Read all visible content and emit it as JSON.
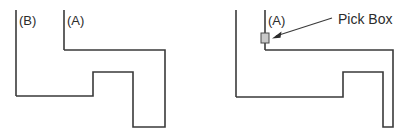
{
  "canvas": {
    "width": 419,
    "height": 137,
    "background": "#ffffff"
  },
  "style": {
    "line_color": "#3a3a3a",
    "text_color": "#2b2b2b",
    "pickbox_fill": "#c9c9c9",
    "pickbox_stroke": "#4a4a4a"
  },
  "figures": [
    {
      "id": "figure-left",
      "name": "two-edges-unselected",
      "labels": [
        {
          "id": "label-b",
          "text": "(B)",
          "x": 19,
          "y": 25
        },
        {
          "id": "label-a",
          "text": "(A)",
          "x": 67,
          "y": 25
        }
      ],
      "leader_lines": [
        {
          "id": "leader-b",
          "x1": 16,
          "y1": 10,
          "x2": 16,
          "y2": 96
        },
        {
          "id": "leader-a",
          "x1": 64,
          "y1": 10,
          "x2": 64,
          "y2": 50
        }
      ],
      "outline_points": "16,96 93,96 93,72 133,72 133,127 165,127 165,50 64,50",
      "outline_description": "stepped L-shaped profile with rectangular notch"
    },
    {
      "id": "figure-right",
      "name": "edge-a-with-pick-box",
      "labels": [
        {
          "id": "label-a-right",
          "text": "(A)",
          "x": 58,
          "y": 25
        }
      ],
      "leader_lines": [
        {
          "id": "leader-b-right",
          "x1": 26,
          "y1": 10,
          "x2": 26,
          "y2": 97
        },
        {
          "id": "leader-a-right",
          "x1": 55,
          "y1": 10,
          "x2": 55,
          "y2": 50
        }
      ],
      "outline_points": "26,97 133,97 133,72 173,72 173,127 183,127 183,50 55,50",
      "outline_description": "stepped L-shaped profile with rectangular notch",
      "pick_box": {
        "id": "pick-box-marker",
        "x": 51,
        "y": 33,
        "width": 8,
        "height": 10
      },
      "callout": {
        "id": "pick-box-callout",
        "text": "Pick Box",
        "text_x": 128,
        "text_y": 24,
        "leader": {
          "x1": 122,
          "y1": 18,
          "x2": 66,
          "y2": 36
        },
        "arrow_tip_x": 62,
        "arrow_tip_y": 38
      }
    }
  ]
}
